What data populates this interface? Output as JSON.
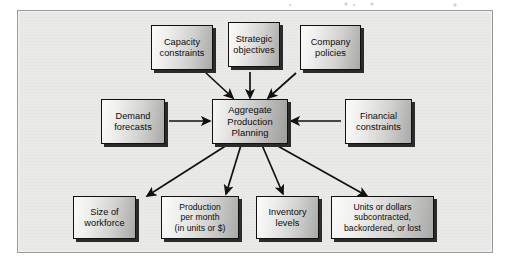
{
  "figure": {
    "kind": "flow-diagram",
    "frame_background": "#e9e9e7",
    "node_border_color": "#111111",
    "node_shadow_color": "#2b2b2b",
    "arrow_color": "#111111"
  },
  "center": {
    "label": "Aggregate\nProduction\nPlanning"
  },
  "inputs_top": [
    {
      "id": "capacity-constraints",
      "label": "Capacity\nconstraints"
    },
    {
      "id": "strategic-objectives",
      "label": "Strategic\nobjectives"
    },
    {
      "id": "company-policies",
      "label": "Company\npolicies"
    }
  ],
  "inputs_left": [
    {
      "id": "demand-forecasts",
      "label": "Demand\nforecasts"
    }
  ],
  "inputs_right": [
    {
      "id": "financial-constraints",
      "label": "Financial\nconstraints"
    }
  ],
  "outputs_bottom": [
    {
      "id": "size-of-workforce",
      "label": "Size of\nworkforce"
    },
    {
      "id": "production-per-month",
      "label": "Production\nper month\n(in units or $)"
    },
    {
      "id": "inventory-levels",
      "label": "Inventory\nlevels"
    },
    {
      "id": "units-or-dollars",
      "label": "Units or dollars\nsubcontracted,\nbackordered, or lost"
    }
  ]
}
